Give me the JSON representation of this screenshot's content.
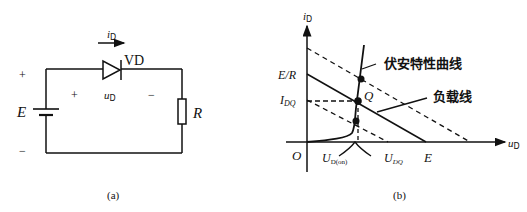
{
  "figure_a": {
    "caption": "(a)",
    "current_label_main": "i",
    "current_label_sub": "D",
    "diode_label": "VD",
    "diode_voltage_main": "u",
    "diode_voltage_sub": "D",
    "diode_plus": "+",
    "diode_minus": "−",
    "source_label": "E",
    "source_plus": "+",
    "source_minus": "−",
    "resistor_label": "R"
  },
  "figure_b": {
    "caption": "(b)",
    "y_axis_main": "i",
    "y_axis_sub": "D",
    "x_axis_main": "u",
    "x_axis_sub": "D",
    "origin_label": "O",
    "y_intercept_label": "E/R",
    "idq_main": "I",
    "idq_sub": "DQ",
    "q_label": "Q",
    "ud_on_main": "U",
    "ud_on_sub": "D(on)",
    "udq_main": "U",
    "udq_sub": "DQ",
    "x_intercept_label": "E",
    "vi_curve_label": "伏安特性曲线",
    "load_line_label": "负载线"
  }
}
